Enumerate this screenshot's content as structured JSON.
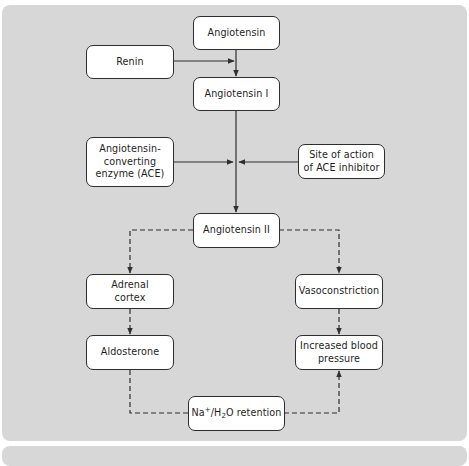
{
  "diagram": {
    "colors": {
      "background": "#d7d7d7",
      "node_fill": "#ffffff",
      "stroke": "#2e2e2e"
    },
    "nodes": {
      "angiotensin": {
        "label": "Angiotensin"
      },
      "renin": {
        "label": "Renin"
      },
      "angiotensin_i": {
        "label": "Angiotensin I"
      },
      "ace": {
        "line1": "Angiotensin-",
        "line2": "converting",
        "line3": "enzyme (ACE)"
      },
      "ace_inhibitor": {
        "line1": "Site of action",
        "line2": "of ACE inhibitor"
      },
      "angiotensin_ii": {
        "label": "Angiotensin II"
      },
      "adrenal_cortex": {
        "line1": "Adrenal",
        "line2": "cortex"
      },
      "vasoconstriction": {
        "label": "Vasoconstriction"
      },
      "aldosterone": {
        "label": "Aldosterone"
      },
      "increased_bp": {
        "line1": "Increased blood",
        "line2": "pressure"
      },
      "na_retention": {
        "pre": "Na",
        "sup": "+",
        "mid": "/H",
        "sub": "2",
        "post": "O retention"
      }
    },
    "edges": [
      {
        "from": "Angiotensin",
        "to": "Angiotensin I",
        "style": "solid"
      },
      {
        "from": "Renin",
        "to": "Angiotensin → Angiotensin I",
        "style": "solid"
      },
      {
        "from": "Angiotensin I",
        "to": "Angiotensin II",
        "style": "solid"
      },
      {
        "from": "Angiotensin-converting enzyme (ACE)",
        "to": "Angiotensin I → Angiotensin II",
        "style": "solid"
      },
      {
        "from": "Site of action of ACE inhibitor",
        "to": "Angiotensin I → Angiotensin II",
        "style": "solid"
      },
      {
        "from": "Angiotensin II",
        "to": "Adrenal cortex",
        "style": "dashed"
      },
      {
        "from": "Angiotensin II",
        "to": "Vasoconstriction",
        "style": "dashed"
      },
      {
        "from": "Adrenal cortex",
        "to": "Aldosterone",
        "style": "dashed"
      },
      {
        "from": "Vasoconstriction",
        "to": "Increased blood pressure",
        "style": "dashed"
      },
      {
        "from": "Aldosterone",
        "to": "Na+/H2O retention",
        "style": "dashed"
      },
      {
        "from": "Na+/H2O retention",
        "to": "Increased blood pressure",
        "style": "dashed"
      }
    ]
  }
}
